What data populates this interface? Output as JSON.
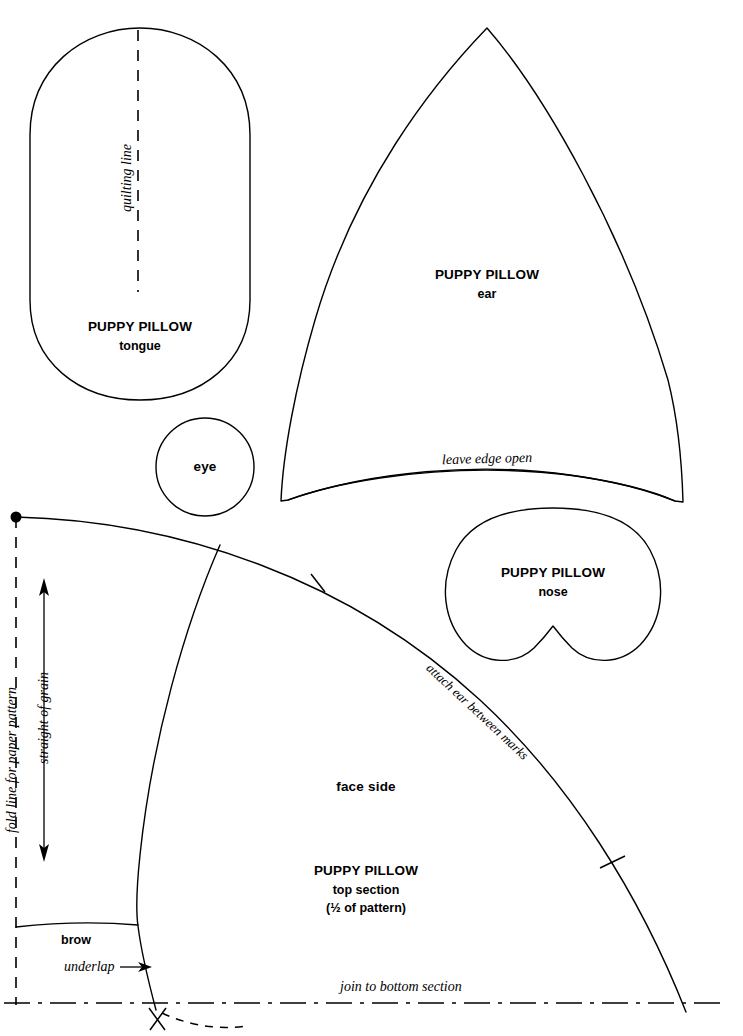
{
  "sheet": {
    "title": "Puppy Pillow Pattern Sheet",
    "brand": "PUPPY PILLOW",
    "ink_color": "#000000",
    "paper_color": "#ffffff"
  },
  "pieces": {
    "tongue": {
      "brand": "PUPPY PILLOW",
      "name": "tongue",
      "marking": "quilting line"
    },
    "ear": {
      "brand": "PUPPY PILLOW",
      "name": "ear",
      "marking": "leave edge open"
    },
    "eye": {
      "name": "eye"
    },
    "nose": {
      "brand": "PUPPY PILLOW",
      "name": "nose"
    },
    "top_section": {
      "brand": "PUPPY PILLOW",
      "name": "top section",
      "fraction_note": "(½ of pattern)",
      "face_side": "face side",
      "brow": "brow",
      "underlap": "underlap",
      "grain": "straight of grain",
      "fold_line": "fold line for paper pattern",
      "attach_ear": "attach ear between marks",
      "join_bottom": "join to bottom section"
    }
  }
}
